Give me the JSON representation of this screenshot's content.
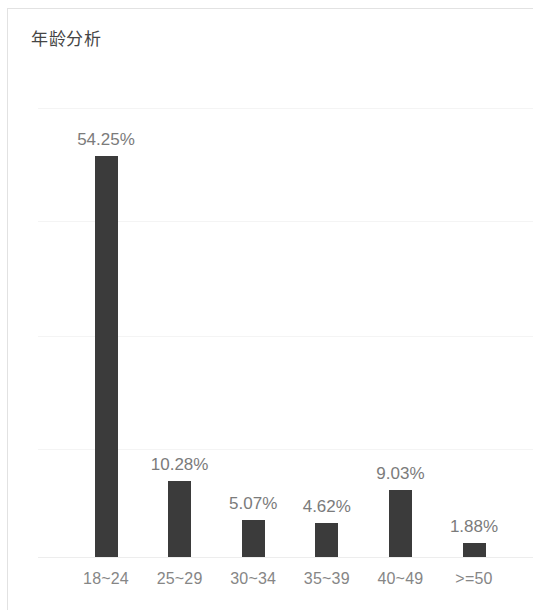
{
  "card": {
    "title": "年龄分析"
  },
  "chart_data": {
    "type": "bar",
    "title": "年龄分析",
    "xlabel": "",
    "ylabel": "",
    "categories": [
      "18~24",
      "25~29",
      "30~34",
      "35~39",
      "40~49",
      ">=50"
    ],
    "values": [
      54.25,
      10.28,
      5.07,
      4.62,
      9.03,
      1.88
    ],
    "value_labels": [
      "54.25%",
      "10.28%",
      "5.07%",
      "4.62%",
      "9.03%",
      "1.88%"
    ],
    "unit": "%",
    "ylim": [
      0,
      60
    ],
    "gridlines": [
      15,
      30,
      45,
      60
    ],
    "grid": true,
    "legend": false,
    "series": [
      {
        "name": "年龄分析",
        "color": "#3b3b3b",
        "values": [
          54.25,
          10.28,
          5.07,
          4.62,
          9.03,
          1.88
        ]
      }
    ],
    "colors": {
      "bar": "#3b3b3b",
      "label": "#7b7b7b",
      "category": "#868686",
      "grid": "#f4f4f4",
      "title": "#454545",
      "background": "#ffffff",
      "border": "#e2e2e2"
    }
  }
}
